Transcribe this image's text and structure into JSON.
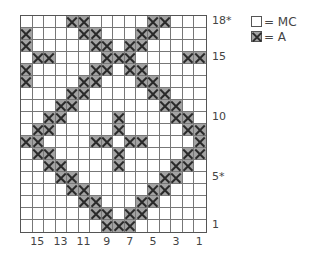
{
  "chart": {
    "title": "",
    "columns": 16,
    "rows": 18,
    "symbols": {
      "X": "A",
      ".": "MC"
    },
    "colors": {
      "contrast_fill": "#a3a3a3",
      "mc_fill": "#ffffff",
      "grid": "#777777",
      "x_stroke": "#2a2a2a"
    },
    "grid_top_to_bottom": [
      "....XX.....XX...",
      "X....XX...XX....",
      "X.....XX.XX.....",
      ".XX....XXX....XX",
      "X.....XX.XX.....",
      "X....XX...XX....",
      "....XX.....XX...",
      "...XX.......XX..",
      "..XX....X....XX.",
      ".XX.....X.....XX",
      "XX....XX.XX....X",
      ".XX.....X.....XX",
      "..XX....X....XX.",
      "...XX.......XX..",
      "....XX.....XX...",
      ".....XX...XX....",
      "......XX.XX.....",
      ".......XXX......"
    ],
    "row_labels": [
      {
        "row": 18,
        "text": "18*"
      },
      {
        "row": 15,
        "text": "15"
      },
      {
        "row": 10,
        "text": "10"
      },
      {
        "row": 5,
        "text": "5*"
      },
      {
        "row": 1,
        "text": "1"
      }
    ],
    "column_labels": [
      {
        "col_index": 1,
        "text": "15"
      },
      {
        "col_index": 3,
        "text": "13"
      },
      {
        "col_index": 5,
        "text": "11"
      },
      {
        "col_index": 7,
        "text": "9"
      },
      {
        "col_index": 9,
        "text": "7"
      },
      {
        "col_index": 11,
        "text": "5"
      },
      {
        "col_index": 13,
        "text": "3"
      },
      {
        "col_index": 15,
        "text": "1"
      }
    ]
  },
  "legend": {
    "items": [
      {
        "symbol": "mc",
        "label": "= MC"
      },
      {
        "symbol": "a",
        "label": "= A"
      }
    ]
  }
}
